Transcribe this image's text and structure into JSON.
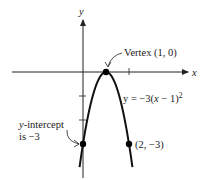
{
  "chart_data": {
    "type": "line",
    "title": "",
    "xlabel": "x",
    "ylabel": "y",
    "function": "y = -3(x - 1)^2",
    "equation_label": {
      "pre": "y = −3(",
      "var": "x",
      "post": " − 1)",
      "exp": "2"
    },
    "x_domain": [
      -0.15,
      2.15
    ],
    "xlim": [
      -3.6,
      4.6
    ],
    "ylim": [
      -4.3,
      2.2
    ],
    "x_ticks": [
      2
    ],
    "y_ticks": [
      -1,
      -2
    ],
    "grid": false,
    "points": [
      {
        "name": "vertex",
        "x": 1,
        "y": 0,
        "label": "Vertex (1, 0)"
      },
      {
        "name": "y-intercept",
        "x": 0,
        "y": -3,
        "label_line1_italic": "y",
        "label_line1_rest": "-intercept",
        "label_line2": "is −3"
      },
      {
        "name": "symmetric-point",
        "x": 2,
        "y": -3,
        "label": "(2, −3)"
      }
    ],
    "colors": {
      "curve": "#111111",
      "axis": "#222222",
      "text": "#1a1a1a"
    }
  }
}
